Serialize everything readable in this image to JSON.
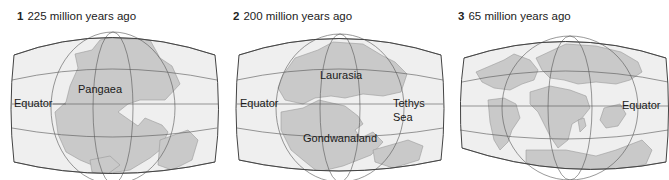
{
  "figure": {
    "colors": {
      "ocean": "#efefef",
      "land": "#c9c9c9",
      "land_edge": "#9a9a9a",
      "grid": "#555555",
      "frame": "#444444",
      "text": "#1a1a1a"
    },
    "panels": [
      {
        "number": "1",
        "title": "225 million years ago",
        "labels": {
          "supercontinent": "Pangaea",
          "equator": "Equator"
        }
      },
      {
        "number": "2",
        "title": "200 million years ago",
        "labels": {
          "north": "Laurasia",
          "south": "Gondwanaland",
          "equator": "Equator",
          "sea_line1": "Tethys",
          "sea_line2": "Sea"
        }
      },
      {
        "number": "3",
        "title": "65 million years ago",
        "labels": {
          "equator": "Equator"
        }
      }
    ]
  }
}
